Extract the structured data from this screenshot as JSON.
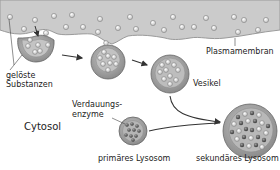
{
  "labels": {
    "plasmamembran": "Plasmamembran",
    "geloeste_line1": "gelöste",
    "geloeste_line2": "Substanzen",
    "vesikel": "Vesikel",
    "verdauungs_line1": "Verdauungs-",
    "verdauungs_line2": "enzyme",
    "cytosol": "Cytosol",
    "primaeres_lysosom": "primäres Lysosom",
    "sekundaeres_lysosom": "sekundäres Lysosom"
  },
  "colors": {
    "extracellular": "#c9c9c9",
    "membrane_line": "#8a8a8a",
    "vesicle_fill": "#9a9a9a",
    "vesicle_inner": "#b8b8b8",
    "particle_light": "#e6e6e6",
    "particle_dark": "#555555",
    "arrow": "#333333",
    "text": "#222222"
  },
  "stages": [
    {
      "name": "invagination",
      "cx": 30,
      "cy": 42
    },
    {
      "name": "budding",
      "cx": 108,
      "cy": 60
    },
    {
      "name": "vesicle",
      "cx": 170,
      "cy": 75
    },
    {
      "name": "primary-lysosome",
      "cx": 133,
      "cy": 131
    },
    {
      "name": "secondary-lysosome",
      "cx": 250,
      "cy": 131
    }
  ]
}
